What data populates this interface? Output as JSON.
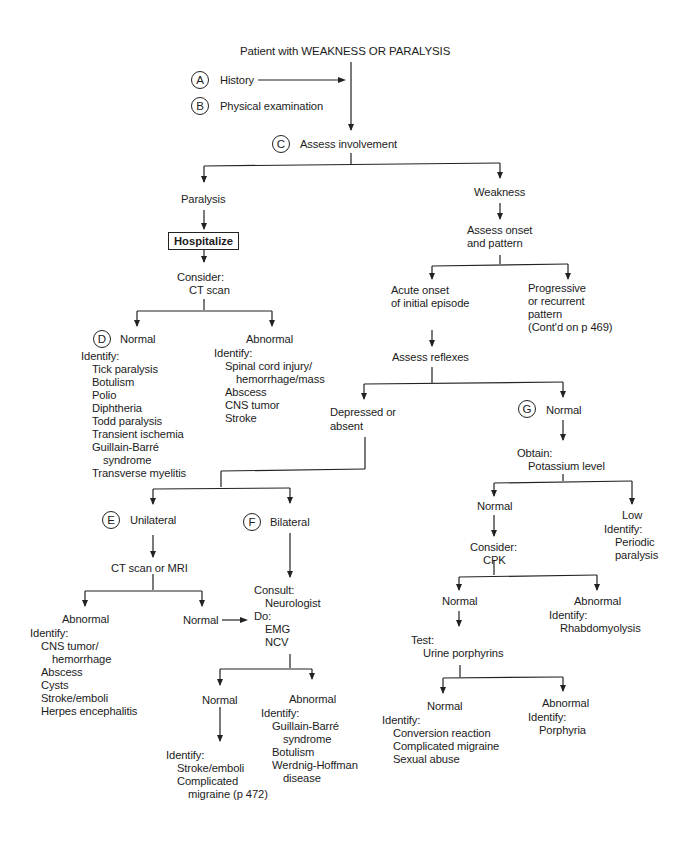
{
  "title": "Patient with WEAKNESS OR PARALYSIS",
  "steps": {
    "A": {
      "marker": "A",
      "label": "History"
    },
    "B": {
      "marker": "B",
      "label": "Physical examination"
    },
    "C": {
      "marker": "C",
      "label": "Assess involvement"
    }
  },
  "paralysis": {
    "label": "Paralysis",
    "action": "Hospitalize",
    "consider_label": "Consider:",
    "consider_value": "CT scan",
    "normal": {
      "marker": "D",
      "label": "Normal",
      "identify_label": "Identify:",
      "items": [
        "Tick paralysis",
        "Botulism",
        "Polio",
        "Diphtheria",
        "Todd paralysis",
        "Transient ischemia",
        "Guillain-Barré",
        "syndrome",
        "Transverse myelitis"
      ]
    },
    "abnormal": {
      "label": "Abnormal",
      "identify_label": "Identify:",
      "items": [
        "Spinal cord injury/",
        "hemorrhage/mass",
        "Abscess",
        "CNS tumor",
        "Stroke"
      ]
    }
  },
  "weakness": {
    "label": "Weakness",
    "assess_line1": "Assess onset",
    "assess_line2": "and pattern",
    "acute": {
      "line1": "Acute onset",
      "line2": "of initial episode"
    },
    "progressive": {
      "line1": "Progressive",
      "line2": "or recurrent",
      "line3": "pattern",
      "line4": "(Cont'd on p 469)"
    },
    "assess_reflexes": "Assess reflexes",
    "depressed": {
      "line1": "Depressed or",
      "line2": "absent"
    },
    "reflex_normal": {
      "marker": "G",
      "label": "Normal",
      "obtain_label": "Obtain:",
      "obtain_value": "Potassium level",
      "k_normal": {
        "label": "Normal",
        "consider_label": "Consider:",
        "consider_value": "CPK",
        "cpk_normal": {
          "label": "Normal",
          "test_label": "Test:",
          "test_value": "Urine porphyrins",
          "up_normal": {
            "label": "Normal",
            "identify_label": "Identify:",
            "items": [
              "Conversion reaction",
              "Complicated migraine",
              "Sexual abuse"
            ]
          },
          "up_abnormal": {
            "label": "Abnormal",
            "identify_label": "Identify:",
            "items": [
              "Porphyria"
            ]
          }
        },
        "cpk_abnormal": {
          "label": "Abnormal",
          "identify_label": "Identify:",
          "items": [
            "Rhabdomyolysis"
          ]
        }
      },
      "k_low": {
        "label": "Low",
        "identify_label": "Identify:",
        "items": [
          "Periodic",
          "paralysis"
        ]
      }
    },
    "unilateral": {
      "marker": "E",
      "label": "Unilateral",
      "test": "CT scan or MRI",
      "abnormal": {
        "label": "Abnormal",
        "identify_label": "Identify:",
        "items": [
          "CNS tumor/",
          "hemorrhage",
          "Abscess",
          "Cysts",
          "Stroke/emboli",
          "Herpes encephalitis"
        ]
      },
      "normal": {
        "label": "Normal"
      }
    },
    "bilateral": {
      "marker": "F",
      "label": "Bilateral",
      "consult_label": "Consult:",
      "consult_value": "Neurologist",
      "do_label": "Do:",
      "do_items": [
        "EMG",
        "NCV"
      ],
      "normal": {
        "label": "Normal",
        "identify_label": "Identify:",
        "items": [
          "Stroke/emboli",
          "Complicated",
          "migraine (p 472)"
        ]
      },
      "abnormal": {
        "label": "Abnormal",
        "identify_label": "Identify:",
        "items": [
          "Guillain-Barré",
          "syndrome",
          "Botulism",
          "Werdnig-Hoffman",
          "disease"
        ]
      }
    }
  }
}
